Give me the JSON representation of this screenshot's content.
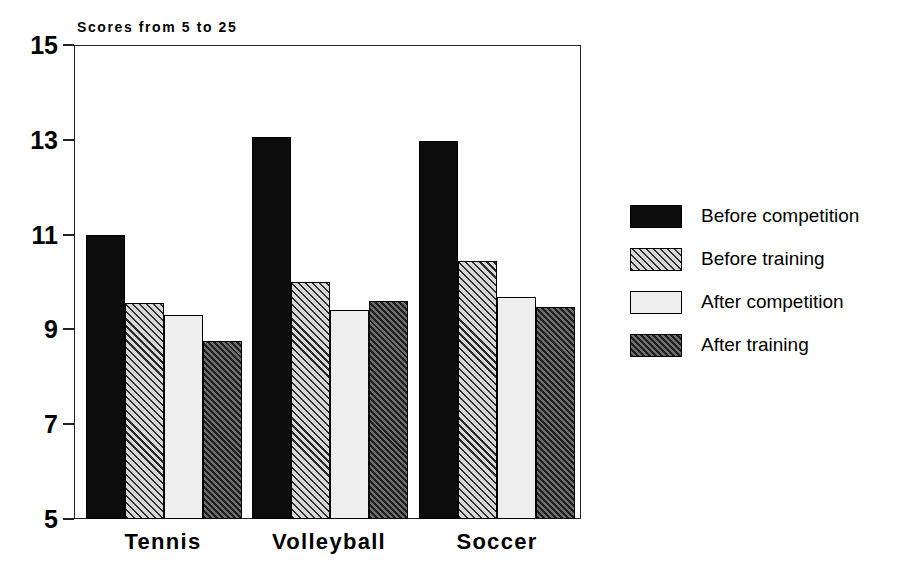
{
  "chart_data": {
    "type": "bar",
    "title": "Scores from 5 to 25",
    "xlabel": "",
    "ylabel": "",
    "categories": [
      "Tennis",
      "Volleyball",
      "Soccer"
    ],
    "series": [
      {
        "name": "Before competition",
        "pattern": "solid-black",
        "values": [
          11.0,
          13.05,
          12.97
        ]
      },
      {
        "name": "Before training",
        "pattern": "light-hatch",
        "values": [
          9.55,
          10.0,
          10.45
        ]
      },
      {
        "name": "After competition",
        "pattern": "very-light",
        "values": [
          9.3,
          9.4,
          9.68
        ]
      },
      {
        "name": "After training",
        "pattern": "dark-hatch",
        "values": [
          8.75,
          9.6,
          9.47
        ]
      }
    ],
    "ylim": [
      5,
      15
    ],
    "yticks": [
      15,
      13,
      11,
      9,
      7,
      5
    ],
    "ytick_labels": [
      "15",
      "13",
      "11",
      "9",
      "7",
      "5"
    ],
    "grid": false,
    "legend_position": "right",
    "frame": true
  },
  "axis": {
    "ticks": [
      {
        "label": "15",
        "value": 15
      },
      {
        "label": "13",
        "value": 13
      },
      {
        "label": "11",
        "value": 11
      },
      {
        "label": "9",
        "value": 9
      },
      {
        "label": "7",
        "value": 7
      },
      {
        "label": "5",
        "value": 5
      }
    ]
  },
  "legend": {
    "items": [
      {
        "label": "Before competition",
        "swatch": "before-competition"
      },
      {
        "label": "Before training",
        "swatch": "before-training"
      },
      {
        "label": "After competition",
        "swatch": "after-competition"
      },
      {
        "label": "After training",
        "swatch": "after-training"
      }
    ]
  },
  "colors": {
    "ink": "#000000",
    "frame": "#222222",
    "background": "#ffffff",
    "solid_black": "#0d0d0d",
    "light_hatch_fill": "#d8d8d8",
    "very_light": "#eeeeee",
    "dark_hatch_fill": "#6e6e6e"
  },
  "geometry": {
    "plot": {
      "left": 74,
      "top": 45,
      "width": 507,
      "height": 474
    },
    "baseline_y": 519,
    "top_y": 45,
    "y_min": 5,
    "y_max": 15,
    "group_starts": [
      86,
      252,
      419
    ],
    "bar_width": 39,
    "label_centers": [
      163,
      329,
      497
    ]
  }
}
